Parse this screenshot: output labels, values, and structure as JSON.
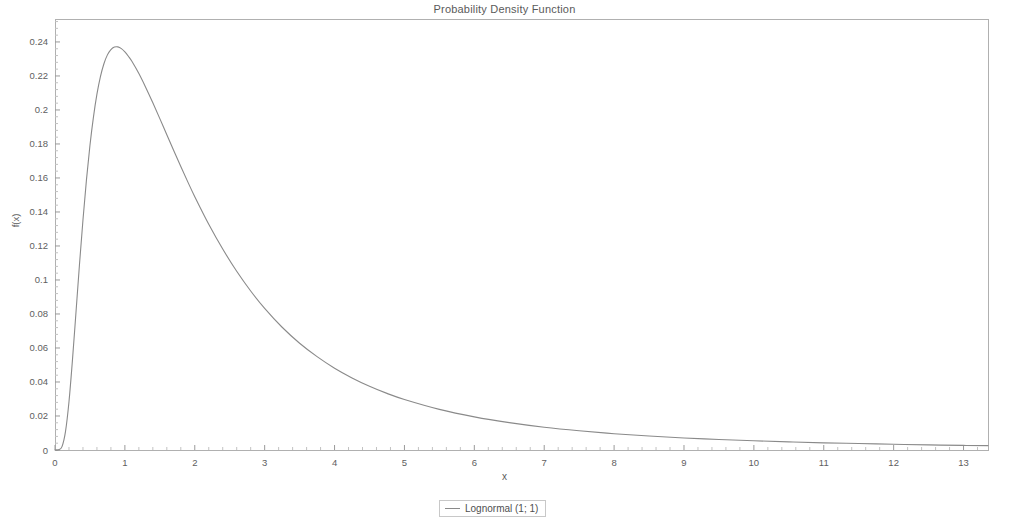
{
  "chart_data": {
    "type": "line",
    "title": "Probability Density Function",
    "xlabel": "x",
    "ylabel": "f(x)",
    "xlim": [
      0,
      13.35
    ],
    "ylim": [
      0,
      0.2535
    ],
    "grid": false,
    "legend_position": "bottom-center",
    "xticks": [
      "0",
      "1",
      "2",
      "3",
      "4",
      "5",
      "6",
      "7",
      "8",
      "9",
      "10",
      "11",
      "12",
      "13"
    ],
    "xtick_values": [
      0,
      1,
      2,
      3,
      4,
      5,
      6,
      7,
      8,
      9,
      10,
      11,
      12,
      13
    ],
    "yticks": [
      "0",
      "0.02",
      "0.04",
      "0.06",
      "0.08",
      "0.1",
      "0.12",
      "0.14",
      "0.16",
      "0.18",
      "0.2",
      "0.22",
      "0.24"
    ],
    "ytick_values": [
      0,
      0.02,
      0.04,
      0.06,
      0.08,
      0.1,
      0.12,
      0.14,
      0.16,
      0.18,
      0.2,
      0.22,
      0.24
    ],
    "series": [
      {
        "name": "Lognormal (1; 1)",
        "color": "#8a8a8a",
        "x": [
          0.0,
          0.05,
          0.1,
          0.15,
          0.2,
          0.25,
          0.3,
          0.35,
          0.4,
          0.45,
          0.5,
          0.55,
          0.6,
          0.65,
          0.7,
          0.75,
          0.8,
          0.85,
          0.9,
          0.95,
          1.0,
          1.05,
          1.1,
          1.2,
          1.3,
          1.4,
          1.5,
          1.6,
          1.7,
          1.8,
          1.9,
          2.0,
          2.2,
          2.4,
          2.6,
          2.8,
          3.0,
          3.25,
          3.5,
          3.75,
          4.0,
          4.25,
          4.5,
          4.75,
          5.0,
          5.5,
          6.0,
          6.5,
          7.0,
          7.5,
          8.0,
          8.5,
          9.0,
          9.5,
          10.0,
          10.5,
          11.0,
          11.5,
          12.0,
          12.5,
          13.0,
          13.35
        ],
        "y": [
          0.0,
          0.0001,
          0.002,
          0.0108,
          0.0284,
          0.053,
          0.0809,
          0.109,
          0.1353,
          0.1589,
          0.1791,
          0.1958,
          0.2093,
          0.2196,
          0.2272,
          0.2324,
          0.2355,
          0.237,
          0.2371,
          0.2361,
          0.2342,
          0.2316,
          0.2286,
          0.2214,
          0.2131,
          0.2042,
          0.1949,
          0.1854,
          0.176,
          0.1667,
          0.1577,
          0.149,
          0.1328,
          0.1182,
          0.1051,
          0.0935,
          0.0833,
          0.0722,
          0.0628,
          0.0549,
          0.0481,
          0.0424,
          0.0375,
          0.0333,
          0.0297,
          0.0239,
          0.0195,
          0.0161,
          0.0134,
          0.0113,
          0.0096,
          0.0082,
          0.0071,
          0.0062,
          0.0054,
          0.0048,
          0.0042,
          0.0038,
          0.0034,
          0.003,
          0.0027,
          0.0026
        ]
      }
    ]
  },
  "legend": {
    "entries": [
      {
        "label": "Lognormal (1; 1)"
      }
    ]
  }
}
